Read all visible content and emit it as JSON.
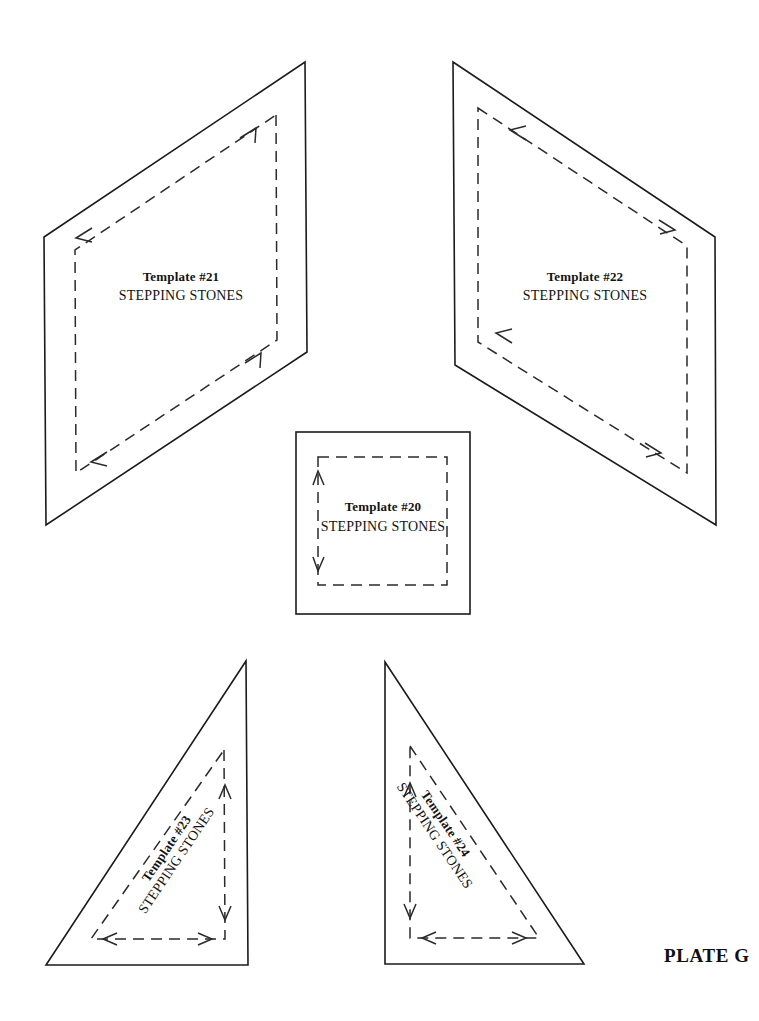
{
  "page": {
    "background_color": "#ffffff",
    "ink_color": "#1b1b1b",
    "width": 759,
    "height": 1021,
    "plate_label": "PLATE G",
    "document_kind": "quilting template plate"
  },
  "templates": [
    {
      "id": "template-21",
      "number": "Template #21",
      "pattern_name": "STEPPING STONES",
      "shape": "parallelogram",
      "cut_line_points": "305,62 716,62 44,237 44,237",
      "outline": "46,525 44,237 305,62 307,352",
      "seam_allowance_line": "true",
      "label_x": 181,
      "label_title_y": 281,
      "label_sub_y": 300,
      "label_rotation": 0
    },
    {
      "id": "template-22",
      "number": "Template #22",
      "pattern_name": "STEPPING STONES",
      "shape": "parallelogram",
      "outline": "453,62 715,237 716,525 455,365",
      "seam_allowance_line": "true",
      "label_x": 585,
      "label_title_y": 281,
      "label_sub_y": 300,
      "label_rotation": 0
    },
    {
      "id": "template-20",
      "number": "Template #20",
      "pattern_name": "STEPPING STONES",
      "shape": "square",
      "outline": "296,432 470,432 470,614 296,614",
      "seam_allowance_line": "true",
      "label_x": 383,
      "label_title_y": 510,
      "label_sub_y": 530,
      "label_rotation": 0
    },
    {
      "id": "template-23",
      "number": "Template #23",
      "pattern_name": "STEPPING STONES",
      "shape": "right-triangle",
      "outline": "246,661 248,965 46,965",
      "seam_allowance_line": "true",
      "label_x": 170,
      "label_title_y": 851,
      "label_sub_y": 871,
      "label_rotation": -56
    },
    {
      "id": "template-24",
      "number": "Template #24",
      "pattern_name": "STEPPING STONES",
      "shape": "right-triangle",
      "outline": "385,662 584,964 385,964",
      "seam_allowance_line": "true",
      "label_x": 462,
      "label_title_y": 851,
      "label_sub_y": 871,
      "label_rotation": 56
    }
  ],
  "plate_label_position": {
    "x": 664,
    "y": 962
  }
}
